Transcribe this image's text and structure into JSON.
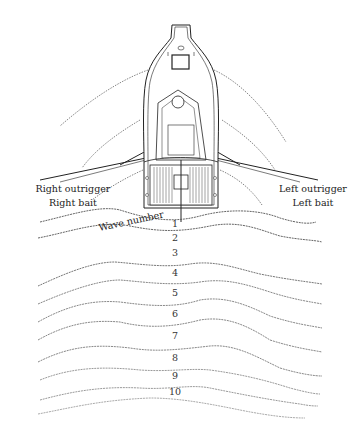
{
  "diagram": {
    "labels": {
      "right_outrigger": "Right outrigger",
      "right_bait": "Right bait",
      "left_outrigger": "Left outrigger",
      "left_bait": "Left bait",
      "wave_number_title": "Wave number"
    },
    "waves": [
      {
        "number": "1",
        "label_x": 175,
        "label_y": 226
      },
      {
        "number": "2",
        "label_x": 175,
        "label_y": 240
      },
      {
        "number": "3",
        "label_x": 175,
        "label_y": 255
      },
      {
        "number": "4",
        "label_x": 175,
        "label_y": 275
      },
      {
        "number": "5",
        "label_x": 175,
        "label_y": 295
      },
      {
        "number": "6",
        "label_x": 175,
        "label_y": 316
      },
      {
        "number": "7",
        "label_x": 175,
        "label_y": 338
      },
      {
        "number": "8",
        "label_x": 175,
        "label_y": 360
      },
      {
        "number": "9",
        "label_x": 175,
        "label_y": 378
      },
      {
        "number": "10",
        "label_x": 175,
        "label_y": 394
      }
    ],
    "colors": {
      "line": "#222222",
      "wave": "#555555",
      "background": "#ffffff"
    }
  }
}
